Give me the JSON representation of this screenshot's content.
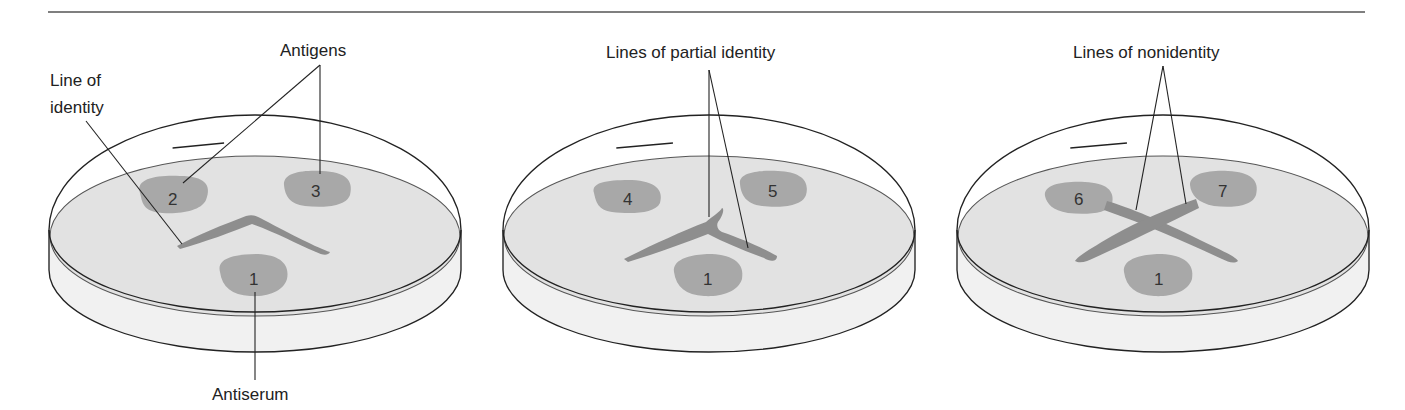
{
  "figure": {
    "colors": {
      "agar": "#e4e4e4",
      "dish_side": "#f0f0f0",
      "well": "#a9a9a9",
      "precipitin_line": "#8c8c8c",
      "outline": "#222222"
    },
    "panels": [
      {
        "name": "identity",
        "labels": {
          "antigens": "Antigens",
          "line_of_identity_1": "Line of",
          "line_of_identity_2": "identity",
          "antiserum": "Antiserum"
        },
        "wells": [
          "2",
          "3",
          "1"
        ]
      },
      {
        "name": "partial-identity",
        "labels": {
          "callout": "Lines of partial identity"
        },
        "wells": [
          "4",
          "5",
          "1"
        ]
      },
      {
        "name": "nonidentity",
        "labels": {
          "callout": "Lines of nonidentity"
        },
        "wells": [
          "6",
          "7",
          "1"
        ]
      }
    ]
  }
}
